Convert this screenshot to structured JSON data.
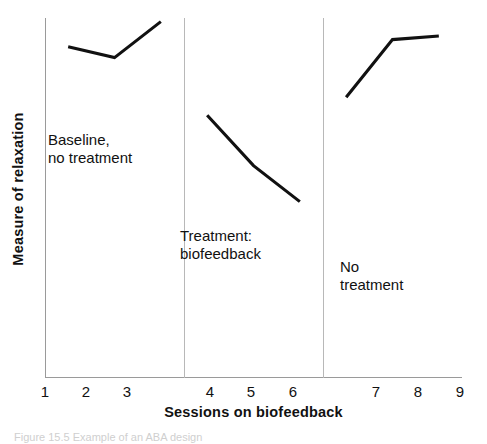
{
  "chart_data": {
    "type": "line",
    "title": "",
    "subtitle": "",
    "xlabel": "Sessions on biofeedback",
    "ylabel": "Measure of relaxation",
    "grid": false,
    "legend_position": "none",
    "x": [
      1,
      2,
      3,
      4,
      5,
      6,
      7,
      8,
      9
    ],
    "xtick_labels": [
      "1",
      "2",
      "3",
      "4",
      "5",
      "6",
      "7",
      "8",
      "9"
    ],
    "xlim": [
      0.5,
      9.5
    ],
    "ylim": [
      0,
      100
    ],
    "ytick_labels": [],
    "series": [
      {
        "name": "Baseline, no treatment",
        "x": [
          1,
          2,
          3
        ],
        "values": [
          92,
          89,
          99
        ]
      },
      {
        "name": "Treatment: biofeedback",
        "x": [
          4,
          5,
          6
        ],
        "values": [
          73,
          59,
          49
        ]
      },
      {
        "name": "No treatment",
        "x": [
          7,
          8,
          9
        ],
        "values": [
          78,
          94,
          95
        ]
      }
    ],
    "phase_dividers": [
      3.5,
      6.5
    ],
    "annotations": [
      {
        "text": "Baseline,\nno treatment",
        "phase": 1
      },
      {
        "text": "Treatment:\nbiofeedback",
        "phase": 2
      },
      {
        "text": "No\ntreatment",
        "phase": 3
      }
    ],
    "colors": {
      "line": "#111111",
      "axis": "#9a9a9a",
      "divider": "#b8b8b8",
      "background": "#ffffff",
      "text": "#111111"
    }
  },
  "axes": {
    "y_title": "Measure of relaxation",
    "x_title": "Sessions on biofeedback"
  },
  "ticks": {
    "x": [
      "1",
      "2",
      "3",
      "4",
      "5",
      "6",
      "7",
      "8",
      "9"
    ]
  },
  "phase_labels": {
    "one": "Baseline,\nno treatment",
    "two": "Treatment:\nbiofeedback",
    "three": "No\ntreatment"
  },
  "caption": {
    "text": "Figure 15.5  Example of an ABA design"
  }
}
